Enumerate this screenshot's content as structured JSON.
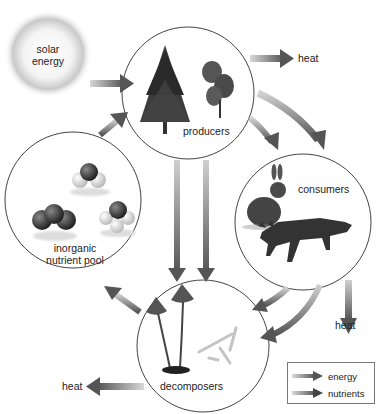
{
  "diagram": {
    "type": "ecosystem energy and nutrient flow",
    "sources": {
      "solar": {
        "label_line1": "solar",
        "label_line2": "energy",
        "icon": "sun-glow"
      }
    },
    "nodes": {
      "producers": {
        "label": "producers",
        "illustration": "pine-tree-and-shrub"
      },
      "consumers": {
        "label": "consumers",
        "illustration": "rabbit-and-fox"
      },
      "decomposers": {
        "label": "decomposers",
        "illustration": "mushrooms-and-bacteria"
      },
      "inorganic_pool": {
        "label_line1": "inorganic",
        "label_line2": "nutrient pool",
        "illustration": "molecules"
      }
    },
    "sinks": {
      "heat_producers": "heat",
      "heat_consumers": "heat",
      "heat_decomposers": "heat"
    },
    "edges": [
      {
        "from": "solar energy",
        "to": "producers",
        "kind": "energy"
      },
      {
        "from": "producers",
        "to": "heat",
        "kind": "energy"
      },
      {
        "from": "producers",
        "to": "consumers",
        "kind": "energy"
      },
      {
        "from": "producers",
        "to": "consumers",
        "kind": "nutrients"
      },
      {
        "from": "producers",
        "to": "decomposers",
        "kind": "energy"
      },
      {
        "from": "producers",
        "to": "decomposers",
        "kind": "nutrients"
      },
      {
        "from": "consumers",
        "to": "heat",
        "kind": "energy"
      },
      {
        "from": "consumers",
        "to": "decomposers",
        "kind": "energy"
      },
      {
        "from": "consumers",
        "to": "decomposers",
        "kind": "nutrients"
      },
      {
        "from": "decomposers",
        "to": "heat",
        "kind": "energy"
      },
      {
        "from": "decomposers",
        "to": "inorganic nutrient pool",
        "kind": "nutrients"
      },
      {
        "from": "inorganic nutrient pool",
        "to": "producers",
        "kind": "nutrients"
      }
    ]
  },
  "legend": {
    "energy": "energy",
    "nutrients": "nutrients"
  },
  "colors": {
    "arrow_dark": "#555555",
    "arrow_light": "#bbbbbb",
    "circle_stroke": "#444444",
    "background": "#ffffff"
  }
}
